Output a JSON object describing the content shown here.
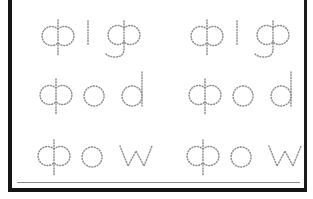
{
  "worksheet": {
    "title": "Handwriting tracing practice worksheet",
    "background_color": "#ffffff",
    "frame_color": "#141414",
    "trace_stroke_color": "#8d8d8d",
    "columns": 2,
    "rows": 3,
    "rows_data": [
      {
        "row_label": "row-1",
        "cells": [
          {
            "word": "pig",
            "column": "left"
          },
          {
            "word": "pig",
            "column": "right"
          }
        ]
      },
      {
        "row_label": "row-2",
        "cells": [
          {
            "word": "pod",
            "column": "left"
          },
          {
            "word": "pod",
            "column": "right"
          }
        ]
      },
      {
        "row_label": "row-3",
        "cells": [
          {
            "word": "pow",
            "column": "left"
          },
          {
            "word": "pow",
            "column": "right"
          }
        ]
      }
    ]
  }
}
